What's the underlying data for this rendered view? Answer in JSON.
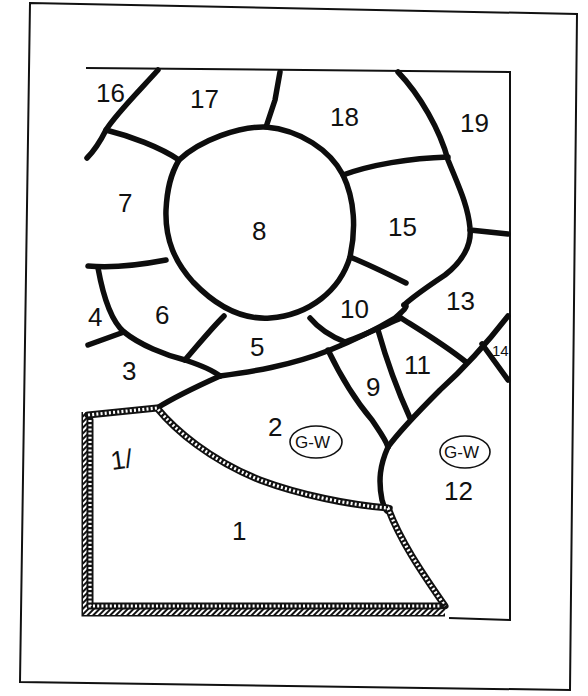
{
  "diagram": {
    "type": "stained-glass pattern",
    "pieces": [
      {
        "id": "1",
        "label": "1"
      },
      {
        "id": "2",
        "label": "2",
        "note": "G-W"
      },
      {
        "id": "3",
        "label": "3"
      },
      {
        "id": "4",
        "label": "4"
      },
      {
        "id": "5",
        "label": "5"
      },
      {
        "id": "6",
        "label": "6"
      },
      {
        "id": "7",
        "label": "7"
      },
      {
        "id": "8",
        "label": "8"
      },
      {
        "id": "9",
        "label": "9"
      },
      {
        "id": "10",
        "label": "10"
      },
      {
        "id": "11",
        "label": "11"
      },
      {
        "id": "12",
        "label": "12",
        "note": "G-W"
      },
      {
        "id": "13",
        "label": "13"
      },
      {
        "id": "14",
        "label": "14"
      },
      {
        "id": "15",
        "label": "15"
      },
      {
        "id": "16",
        "label": "16"
      },
      {
        "id": "17",
        "label": "17"
      },
      {
        "id": "18",
        "label": "18"
      },
      {
        "id": "19",
        "label": "19"
      }
    ],
    "annotations": {
      "glass_note_2": "G-W",
      "glass_note_12": "G-W",
      "side_mark": "1/"
    },
    "colors": {
      "lead": "#0d0d0d",
      "background": "#ffffff"
    }
  }
}
